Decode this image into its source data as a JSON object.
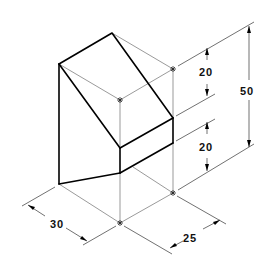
{
  "figure": {
    "type": "isometric-technical-drawing"
  },
  "dimensions": {
    "width_left": {
      "label": "30"
    },
    "depth_right": {
      "label": "25"
    },
    "upper_height": {
      "label": "20"
    },
    "lower_height": {
      "label": "20"
    },
    "total_height": {
      "label": "50"
    }
  },
  "colors": {
    "object_line": "#000000",
    "construction_line": "#555555",
    "background": "#ffffff"
  }
}
